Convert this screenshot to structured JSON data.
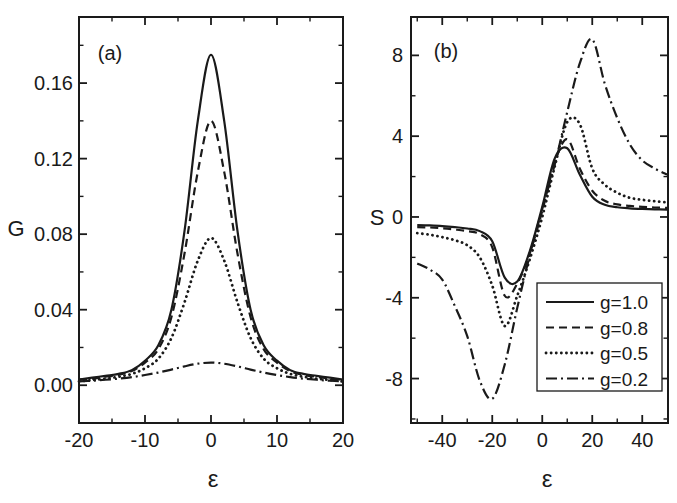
{
  "figure": {
    "bg_color": "#ffffff",
    "ink_color": "#1a1a1a"
  },
  "chart_data": [
    {
      "type": "line",
      "id": "a",
      "panel_label": "(a)",
      "xlabel": "ε",
      "ylabel": "G",
      "xlim": [
        -20,
        20
      ],
      "ylim": [
        -0.02,
        0.195
      ],
      "grid": false,
      "x_major_ticks": [
        {
          "v": -20,
          "label": "-20"
        },
        {
          "v": -10,
          "label": "-10"
        },
        {
          "v": 0,
          "label": "0"
        },
        {
          "v": 10,
          "label": "10"
        },
        {
          "v": 20,
          "label": "20"
        }
      ],
      "x_minor_ticks": [
        -15,
        -5,
        5,
        15
      ],
      "y_major_ticks": [
        {
          "v": 0.0,
          "label": "0.00"
        },
        {
          "v": 0.04,
          "label": "0.04"
        },
        {
          "v": 0.08,
          "label": "0.08"
        },
        {
          "v": 0.12,
          "label": "0.12"
        },
        {
          "v": 0.16,
          "label": "0.16"
        }
      ],
      "y_minor_ticks": [
        0.02,
        0.06,
        0.1,
        0.14,
        0.18
      ],
      "x": [
        -20,
        -18,
        -16,
        -14,
        -12,
        -10,
        -8,
        -6,
        -4,
        -2,
        0,
        2,
        4,
        6,
        8,
        10,
        12,
        14,
        16,
        18,
        20
      ],
      "series": [
        {
          "name": "g=1.0",
          "line_style": "solid",
          "y": [
            0.003,
            0.004,
            0.005,
            0.006,
            0.008,
            0.013,
            0.021,
            0.04,
            0.082,
            0.14,
            0.175,
            0.14,
            0.082,
            0.04,
            0.021,
            0.013,
            0.008,
            0.006,
            0.005,
            0.004,
            0.003
          ]
        },
        {
          "name": "g=0.8",
          "line_style": "dashed",
          "y": [
            0.003,
            0.0035,
            0.0045,
            0.0055,
            0.0075,
            0.012,
            0.019,
            0.036,
            0.07,
            0.113,
            0.14,
            0.113,
            0.07,
            0.036,
            0.019,
            0.012,
            0.0075,
            0.0055,
            0.0045,
            0.0035,
            0.003
          ]
        },
        {
          "name": "g=0.5",
          "line_style": "dotted",
          "y": [
            0.002,
            0.0028,
            0.0035,
            0.0045,
            0.006,
            0.009,
            0.014,
            0.025,
            0.044,
            0.066,
            0.078,
            0.066,
            0.044,
            0.025,
            0.014,
            0.009,
            0.006,
            0.0045,
            0.0035,
            0.0028,
            0.002
          ]
        },
        {
          "name": "g=0.2",
          "line_style": "dash-dot",
          "y": [
            0.002,
            0.0024,
            0.0029,
            0.0035,
            0.0043,
            0.0054,
            0.0067,
            0.0083,
            0.01,
            0.0114,
            0.012,
            0.0114,
            0.01,
            0.0083,
            0.0067,
            0.0054,
            0.0043,
            0.0035,
            0.0029,
            0.0024,
            0.002
          ]
        }
      ]
    },
    {
      "type": "line",
      "id": "b",
      "panel_label": "(b)",
      "xlabel": "ε",
      "ylabel": "S",
      "xlim": [
        -52.5,
        50.3
      ],
      "ylim": [
        -10.2,
        9.9
      ],
      "grid": false,
      "x_major_ticks": [
        {
          "v": -40,
          "label": "-40"
        },
        {
          "v": -20,
          "label": "-20"
        },
        {
          "v": 0,
          "label": "0"
        },
        {
          "v": 20,
          "label": "20"
        },
        {
          "v": 40,
          "label": "40"
        }
      ],
      "x_minor_ticks": [
        -50,
        -30,
        -10,
        10,
        30
      ],
      "y_major_ticks": [
        {
          "v": -8,
          "label": "-8"
        },
        {
          "v": -4,
          "label": "-4"
        },
        {
          "v": 0,
          "label": "0"
        },
        {
          "v": 4,
          "label": "4"
        },
        {
          "v": 8,
          "label": "8"
        }
      ],
      "y_minor_ticks": [
        -10,
        -6,
        -2,
        2,
        6
      ],
      "x": [
        -50,
        -45,
        -40,
        -35,
        -30,
        -25,
        -20,
        -15,
        -10,
        -5,
        0,
        5,
        10,
        15,
        20,
        25,
        30,
        35,
        40,
        45,
        50
      ],
      "series": [
        {
          "name": "g=1.0",
          "line_style": "solid",
          "y": [
            -0.4,
            -0.42,
            -0.45,
            -0.5,
            -0.57,
            -0.7,
            -1.2,
            -3.0,
            -3.2,
            -1.7,
            0.5,
            2.9,
            3.4,
            2.1,
            1.0,
            0.6,
            0.48,
            0.43,
            0.4,
            0.38,
            0.36
          ]
        },
        {
          "name": "g=0.8",
          "line_style": "dashed",
          "y": [
            -0.5,
            -0.52,
            -0.56,
            -0.62,
            -0.7,
            -0.85,
            -1.5,
            -3.9,
            -3.3,
            -1.8,
            0.3,
            2.7,
            3.85,
            2.4,
            1.3,
            0.8,
            0.62,
            0.55,
            0.5,
            0.47,
            0.45
          ]
        },
        {
          "name": "g=0.5",
          "line_style": "dotted",
          "y": [
            -0.8,
            -0.88,
            -1.0,
            -1.15,
            -1.4,
            -2.0,
            -3.4,
            -5.4,
            -3.9,
            -2.1,
            0.0,
            2.5,
            4.7,
            4.6,
            2.4,
            1.6,
            1.2,
            0.95,
            0.85,
            0.78,
            0.72
          ]
        },
        {
          "name": "g=0.2",
          "line_style": "dash-dot",
          "y": [
            -2.3,
            -2.6,
            -3.1,
            -4.4,
            -5.9,
            -8.1,
            -9.0,
            -7.3,
            -4.5,
            -1.9,
            0.4,
            2.6,
            5.2,
            7.6,
            8.8,
            6.6,
            4.9,
            3.6,
            2.8,
            2.4,
            2.1
          ]
        }
      ],
      "legend": {
        "position": "lower-right",
        "entries": [
          {
            "label": "g=1.0",
            "line_style": "solid"
          },
          {
            "label": "g=0.8",
            "line_style": "dashed"
          },
          {
            "label": "g=0.5",
            "line_style": "dotted"
          },
          {
            "label": "g=0.2",
            "line_style": "dash-dot"
          }
        ]
      }
    }
  ]
}
